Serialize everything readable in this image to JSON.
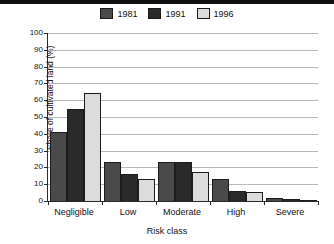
{
  "chart_data": {
    "type": "bar",
    "title": "",
    "xlabel": "Risk class",
    "ylabel": "Share of cultivated land (%)",
    "categories": [
      "Negligible",
      "Low",
      "Moderate",
      "High",
      "Severe"
    ],
    "series": [
      {
        "name": "1981",
        "color": "#4a4a4a",
        "values": [
          41,
          23,
          23,
          13,
          2
        ]
      },
      {
        "name": "1991",
        "color": "#2a2a2a",
        "values": [
          55,
          16,
          23,
          6,
          1
        ]
      },
      {
        "name": "1996",
        "color": "#dcdcdc",
        "values": [
          64,
          13,
          17.5,
          5.5,
          0.5
        ]
      }
    ],
    "ylim": [
      0,
      100
    ],
    "yticks": [
      0,
      10,
      20,
      30,
      40,
      50,
      60,
      70,
      80,
      90,
      100
    ],
    "ytick_labels": [
      "0",
      "10",
      "20",
      "30",
      "40",
      "50",
      "60",
      "70",
      "80",
      "90",
      "100"
    ],
    "grid": true,
    "legend_position": "top-center"
  }
}
